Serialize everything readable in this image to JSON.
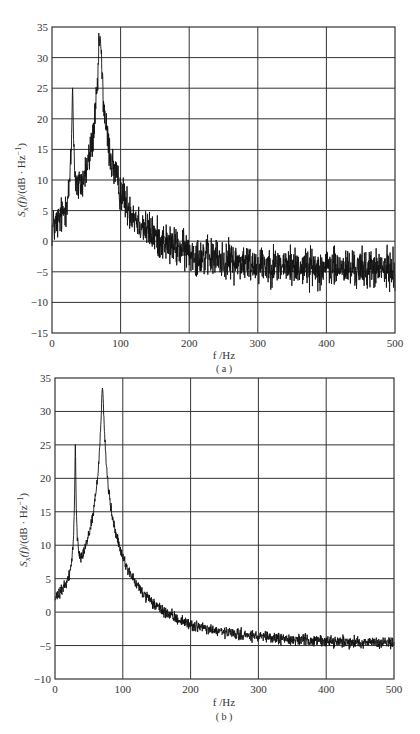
{
  "chart_data": [
    {
      "id": "a",
      "type": "line",
      "caption": "( a )",
      "xlabel": "f /Hz",
      "ylabel": "S_x(f)/(dB · Hz⁻¹)",
      "xlim": [
        0,
        500
      ],
      "ylim": [
        -15,
        35
      ],
      "xticks": [
        0,
        100,
        200,
        300,
        400,
        500
      ],
      "yticks": [
        -15,
        -10,
        -5,
        0,
        5,
        10,
        15,
        20,
        25,
        30,
        35
      ],
      "grid": true,
      "plot_box_px": {
        "left": 52,
        "right": 395,
        "top": 27,
        "bottom": 333
      },
      "series": [
        {
          "name": "power spectral density (noisy)",
          "baseline_db": -5,
          "noise_amplitude_db": 2.6,
          "peaks": [
            {
              "freq_hz": 30,
              "level_db": 25,
              "width_hz": 0.6
            },
            {
              "freq_hz": 70,
              "level_db": 33.5,
              "width_hz": 1.6
            }
          ]
        }
      ]
    },
    {
      "id": "b",
      "type": "line",
      "caption": "( b )",
      "xlabel": "f /Hz",
      "ylabel": "S_x(f)/(dB · Hz⁻¹)",
      "xlim": [
        0,
        500
      ],
      "ylim": [
        -10,
        35
      ],
      "xticks": [
        0,
        100,
        200,
        300,
        400,
        500
      ],
      "yticks": [
        -10,
        -5,
        0,
        5,
        10,
        15,
        20,
        25,
        30,
        35
      ],
      "grid": true,
      "plot_box_px": {
        "left": 55,
        "right": 394,
        "top": 378,
        "bottom": 679
      },
      "series": [
        {
          "name": "power spectral density (smoothed)",
          "baseline_db": -5,
          "noise_amplitude_db": 0.7,
          "peaks": [
            {
              "freq_hz": 30,
              "level_db": 25,
              "width_hz": 0.5
            },
            {
              "freq_hz": 70,
              "level_db": 33.5,
              "width_hz": 1.6
            }
          ]
        }
      ]
    }
  ],
  "labels": {
    "a": {
      "caption": "( a )",
      "xlabel": "f /Hz",
      "ylabel_main": "S",
      "ylabel_sub": "x",
      "ylabel_rest": "(f)/(dB · Hz",
      "ylabel_sup": "−1",
      "ylabel_close": ")"
    },
    "b": {
      "caption": "( b )",
      "xlabel": "f /Hz",
      "ylabel_main": "S",
      "ylabel_sub": "x",
      "ylabel_rest": "(f)/(dB · Hz",
      "ylabel_sup": "−1",
      "ylabel_close": ")"
    }
  }
}
